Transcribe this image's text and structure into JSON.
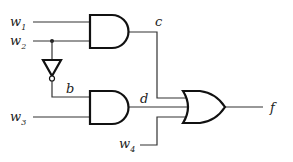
{
  "diagram": {
    "type": "logic-circuit",
    "inputs": [
      {
        "name": "w",
        "sub": "1"
      },
      {
        "name": "w",
        "sub": "2"
      },
      {
        "name": "w",
        "sub": "3"
      },
      {
        "name": "w",
        "sub": "4"
      }
    ],
    "signals": {
      "b": "b",
      "c": "c",
      "d": "d",
      "f": "f"
    },
    "gates": [
      {
        "id": "and1",
        "type": "AND",
        "inputs": [
          "w1",
          "w2"
        ],
        "output": "c"
      },
      {
        "id": "not1",
        "type": "NOT",
        "inputs": [
          "w2"
        ],
        "output": "b"
      },
      {
        "id": "and2",
        "type": "AND",
        "inputs": [
          "b",
          "w3"
        ],
        "output": "d"
      },
      {
        "id": "or1",
        "type": "OR",
        "inputs": [
          "c",
          "d",
          "w4"
        ],
        "output": "f"
      }
    ]
  }
}
